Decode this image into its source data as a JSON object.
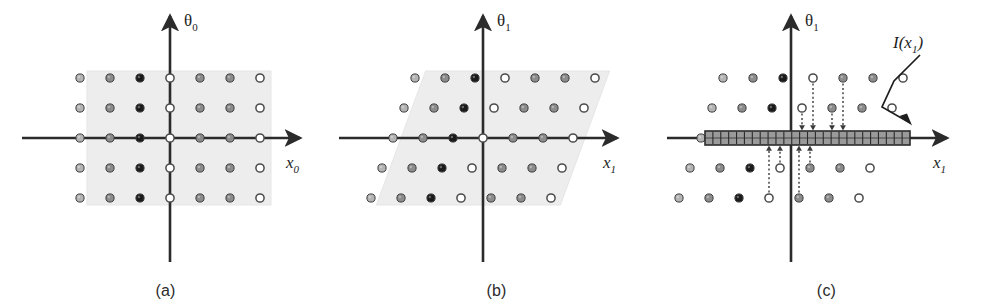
{
  "figure": {
    "kind": "scientific-diagram",
    "panel_count": 3
  },
  "colors": {
    "ink": "#1e1e1e",
    "axis": "#2b2b2b",
    "shade_fill": "#ededed",
    "shade_stroke": "#e2e2e2",
    "dot_black": "#1a1a1a",
    "dot_dark": "#5a5a5a",
    "dot_mid": "#8c8c8c",
    "dot_light": "#b4b4b4",
    "dot_white": "#ffffff",
    "dot_outline": "#4a4a4a",
    "bar_fill": "#9a9a9a",
    "bar_stroke": "#2b2b2b",
    "projection_arrow": "#3a3a3a",
    "caption_text": "#2b2b2b"
  },
  "panels": [
    {
      "id": "a",
      "caption": "(a)",
      "x_axis_label": "x",
      "x_axis_sub": "0",
      "y_axis_label": "θ",
      "y_axis_sub": "0",
      "shade_shape": "rectangle",
      "has_shade": true,
      "has_bar": false,
      "has_projection_arrows": false,
      "shear_per_row": 0,
      "origin": {
        "x": 170,
        "y": 138
      },
      "grid": {
        "columns": 7,
        "rows": 5,
        "col_spacing": 30,
        "row_spacing": 30,
        "col_shades": [
          "dot_light",
          "dot_mid",
          "dot_black",
          "dot_white",
          "dot_mid",
          "dot_mid",
          "dot_white"
        ]
      },
      "shade_rect": {
        "x": 87,
        "y": 71,
        "w": 184,
        "h": 134
      }
    },
    {
      "id": "b",
      "caption": "(b)",
      "x_axis_label": "x",
      "x_axis_sub": "1",
      "y_axis_label": "θ",
      "y_axis_sub": "1",
      "shade_shape": "parallelogram",
      "has_shade": true,
      "has_bar": false,
      "has_projection_arrows": false,
      "shear_per_row": 11,
      "origin": {
        "x": 152,
        "y": 138
      },
      "grid": {
        "columns": 7,
        "rows": 5,
        "col_spacing": 30,
        "row_spacing": 30,
        "col_shades": [
          "dot_light",
          "dot_mid",
          "dot_black",
          "dot_white",
          "dot_mid",
          "dot_mid",
          "dot_white"
        ]
      },
      "shade_rect": {
        "x": 70,
        "y": 71,
        "w": 184,
        "h": 134
      }
    },
    {
      "id": "c",
      "caption": "(c)",
      "x_axis_label": "x",
      "x_axis_sub": "1",
      "y_axis_label": "θ",
      "y_axis_sub": "1",
      "shade_shape": "none",
      "has_shade": false,
      "has_bar": true,
      "has_projection_arrows": true,
      "shear_per_row": 11,
      "origin": {
        "x": 130,
        "y": 138
      },
      "grid": {
        "columns": 7,
        "rows": 5,
        "col_spacing": 30,
        "row_spacing": 30,
        "col_shades": [
          "dot_light",
          "dot_mid",
          "dot_black",
          "dot_white",
          "dot_mid",
          "dot_mid",
          "dot_white"
        ]
      },
      "interval_bar": {
        "label": "I(x",
        "label_sub": "1",
        "label_tail": ")",
        "x": 44,
        "y": 131,
        "w": 205,
        "h": 14,
        "bin_count": 26,
        "annotation_label_pos": {
          "x": 232,
          "y": 48
        }
      },
      "projection_arrows": {
        "style": "dotted",
        "count": 12,
        "direction": "toward-axis"
      }
    }
  ]
}
